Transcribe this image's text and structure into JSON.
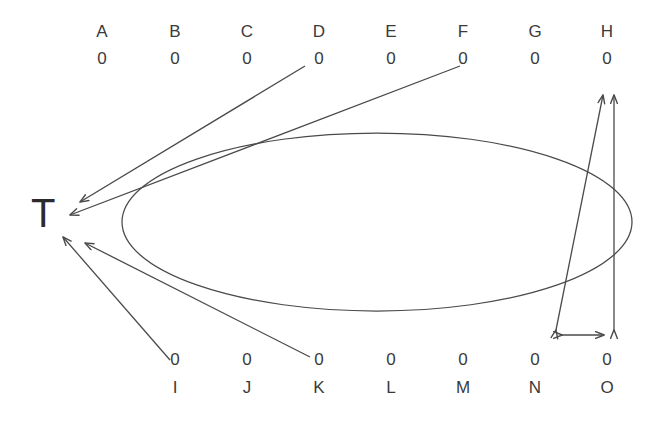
{
  "diagram": {
    "title": "",
    "stroke_color": "#4a4a4a",
    "text_color": "#3a3a3a",
    "background": "#ffffff",
    "target": {
      "label": "T",
      "name": "target-node"
    },
    "top_row": [
      {
        "label": "A",
        "value": "0"
      },
      {
        "label": "B",
        "value": "0"
      },
      {
        "label": "C",
        "value": "0"
      },
      {
        "label": "D",
        "value": "0"
      },
      {
        "label": "E",
        "value": "0"
      },
      {
        "label": "F",
        "value": "0"
      },
      {
        "label": "G",
        "value": "0"
      },
      {
        "label": "H",
        "value": "0"
      }
    ],
    "bottom_row": [
      {
        "label": "I",
        "value": "0"
      },
      {
        "label": "J",
        "value": "0"
      },
      {
        "label": "K",
        "value": "0"
      },
      {
        "label": "L",
        "value": "0"
      },
      {
        "label": "M",
        "value": "0"
      },
      {
        "label": "N",
        "value": "0"
      },
      {
        "label": "O",
        "value": "0"
      }
    ],
    "arrows_to_target": [
      {
        "from": "D",
        "direction": "to-target"
      },
      {
        "from": "F",
        "direction": "to-target"
      },
      {
        "from": "I",
        "direction": "to-target"
      },
      {
        "from": "K",
        "direction": "to-target"
      }
    ],
    "measure_arrows": [
      {
        "name": "slanted-vertical-double-arrow",
        "orientation": "vertical",
        "heads": "both"
      },
      {
        "name": "straight-vertical-double-arrow",
        "orientation": "vertical",
        "heads": "both"
      },
      {
        "name": "horizontal-double-arrow",
        "orientation": "horizontal",
        "heads": "both"
      }
    ],
    "ellipse": {
      "name": "ring-ellipse"
    }
  }
}
